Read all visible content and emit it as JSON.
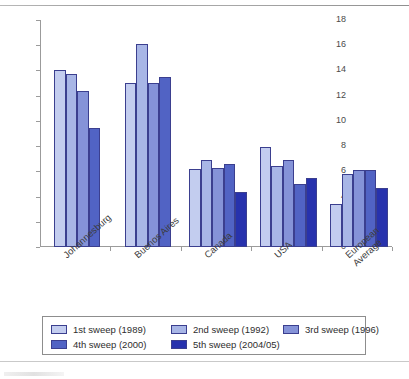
{
  "chart_data": {
    "type": "bar",
    "title": "",
    "subtitle": "",
    "xlabel": "",
    "ylabel": "",
    "ylim": [
      0,
      18
    ],
    "ytick_step": 2,
    "yticks": [
      0,
      2,
      4,
      6,
      8,
      10,
      12,
      14,
      16,
      18
    ],
    "grid": false,
    "legend_position": "bottom",
    "categories": [
      "Johannesburg",
      "Buenos Aires",
      "Canada",
      "USA",
      "European Average"
    ],
    "series": [
      {
        "name": "1st sweep (1989)",
        "color": "#c3cdef",
        "values": [
          14.0,
          13.0,
          6.2,
          7.9,
          3.4
        ]
      },
      {
        "name": "2nd sweep (1992)",
        "color": "#a8b6e6",
        "values": [
          13.7,
          16.1,
          6.9,
          6.4,
          5.8
        ]
      },
      {
        "name": "3rd sweep (1996)",
        "color": "#8593d8",
        "values": [
          12.4,
          13.0,
          6.3,
          6.9,
          6.1
        ]
      },
      {
        "name": "4th sweep (2000)",
        "color": "#5163c4",
        "values": [
          9.4,
          13.5,
          6.6,
          5.0,
          6.1
        ]
      },
      {
        "name": "5th sweep (2004/05)",
        "color": "#2732ad",
        "values": [
          null,
          null,
          4.4,
          5.5,
          4.7
        ]
      }
    ]
  },
  "axis": {
    "tick_labels": [
      "0",
      "2",
      "4",
      "6",
      "8",
      "10",
      "12",
      "14",
      "16",
      "18"
    ]
  },
  "categories": [
    {
      "label": "Johannesburg"
    },
    {
      "label": "Buenos Aires"
    },
    {
      "label": "Canada"
    },
    {
      "label": "USA"
    },
    {
      "label": "European Average"
    }
  ],
  "legend": {
    "items": [
      {
        "label": "1st sweep (1989)",
        "color": "#c3cdef"
      },
      {
        "label": "2nd sweep (1992)",
        "color": "#a8b6e6"
      },
      {
        "label": "3rd sweep (1996)",
        "color": "#8593d8"
      },
      {
        "label": "4th sweep (2000)",
        "color": "#5163c4"
      },
      {
        "label": "5th sweep (2004/05)",
        "color": "#2732ad"
      }
    ]
  }
}
